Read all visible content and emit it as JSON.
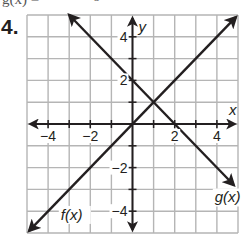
{
  "problem": {
    "number_label": "4.",
    "cutoff_text_left": "g(x) =",
    "cutoff_text_right": "3"
  },
  "colors": {
    "grid": "#b5b5b5",
    "axes": "#231f20",
    "lines": "#231f20",
    "background": "#ffffff"
  },
  "chart_data": {
    "type": "line",
    "title": "",
    "xlabel": "x",
    "ylabel": "y",
    "xlim": [
      -5,
      5
    ],
    "ylim": [
      -5,
      5
    ],
    "grid": true,
    "grid_step": 1,
    "x_tick_labels": [
      {
        "value": -4,
        "label": "−4"
      },
      {
        "value": -2,
        "label": "−2"
      },
      {
        "value": 2,
        "label": "2"
      },
      {
        "value": 4,
        "label": "4"
      }
    ],
    "y_tick_labels": [
      {
        "value": 4,
        "label": "4"
      },
      {
        "value": 2,
        "label": "2"
      },
      {
        "value": -2,
        "label": "−2"
      },
      {
        "value": -4,
        "label": "−4"
      }
    ],
    "series": [
      {
        "name": "f(x)",
        "label": "f(x)",
        "equation": "f(x) = x",
        "slope": 1,
        "intercept": 0,
        "points": [
          [
            -4.9,
            -4.9
          ],
          [
            0,
            0
          ],
          [
            1,
            1
          ],
          [
            4.9,
            4.9
          ]
        ],
        "arrows_both_ends": true,
        "label_position": [
          -3.4,
          -4.4
        ]
      },
      {
        "name": "g(x)",
        "label": "g(x)",
        "equation": "g(x) = -x + 2",
        "slope": -1,
        "intercept": 2,
        "points": [
          [
            -3,
            5
          ],
          [
            0,
            2
          ],
          [
            1,
            1
          ],
          [
            2,
            0
          ],
          [
            4.8,
            -2.8
          ]
        ],
        "arrows_both_ends": true,
        "label_position": [
          3.9,
          -3.6
        ]
      }
    ],
    "annotations": [
      {
        "text": "intersection",
        "point": [
          1,
          1
        ]
      }
    ]
  }
}
